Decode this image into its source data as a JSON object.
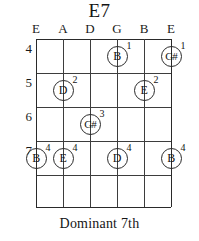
{
  "chord": {
    "title": "E7",
    "caption": "Dominant  7th"
  },
  "string_labels": [
    {
      "label": "E",
      "x": 36
    },
    {
      "label": "A",
      "x": 63
    },
    {
      "label": "D",
      "x": 90
    },
    {
      "label": "G",
      "x": 117
    },
    {
      "label": "B",
      "x": 144
    },
    {
      "label": "E",
      "x": 171
    }
  ],
  "fret_numbers": [
    {
      "label": "4",
      "y": 49
    },
    {
      "label": "5",
      "y": 83
    },
    {
      "label": "6",
      "y": 117
    },
    {
      "label": "7",
      "y": 151
    }
  ],
  "grid": {
    "left": 36,
    "top": 39,
    "width": 135,
    "height": 168,
    "fret_line_y": [
      0,
      34,
      68,
      102,
      136,
      168
    ],
    "string_line_x": [
      0,
      27,
      54,
      81,
      108,
      135
    ]
  },
  "notes": [
    {
      "note": "B",
      "sharp": false,
      "finger": "1",
      "x": 117,
      "y": 56,
      "string": "G",
      "fret": 4
    },
    {
      "note": "G#",
      "sharp": true,
      "finger": "1",
      "x": 171,
      "y": 56,
      "string": "E-high",
      "fret": 4
    },
    {
      "note": "D",
      "sharp": false,
      "finger": "2",
      "x": 63,
      "y": 90,
      "string": "A",
      "fret": 5
    },
    {
      "note": "E",
      "sharp": false,
      "finger": "2",
      "x": 144,
      "y": 90,
      "string": "B",
      "fret": 5
    },
    {
      "note": "G#",
      "sharp": true,
      "finger": "3",
      "x": 90,
      "y": 124,
      "string": "D",
      "fret": 6
    },
    {
      "note": "B",
      "sharp": false,
      "finger": "4",
      "x": 36,
      "y": 158,
      "string": "E-low",
      "fret": 7
    },
    {
      "note": "E",
      "sharp": false,
      "finger": "4",
      "x": 63,
      "y": 158,
      "string": "A",
      "fret": 7
    },
    {
      "note": "D",
      "sharp": false,
      "finger": "4",
      "x": 117,
      "y": 158,
      "string": "G",
      "fret": 7
    },
    {
      "note": "B",
      "sharp": false,
      "finger": "4",
      "x": 171,
      "y": 158,
      "string": "E-high",
      "fret": 7
    }
  ],
  "colors": {
    "ink": "#1a1a1a",
    "grid": "#3d3d3d",
    "background": "#ffffff"
  }
}
